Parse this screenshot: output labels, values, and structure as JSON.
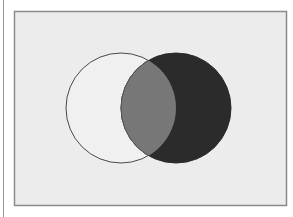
{
  "diagram": {
    "type": "venn",
    "frame": {
      "x": 14,
      "y": 11,
      "width": 272,
      "height": 194,
      "fill": "#ececec",
      "stroke": "#8a8a8a"
    },
    "sets": [
      {
        "name": "A",
        "cx": 121,
        "cy": 108,
        "r": 55,
        "fill": "#f0f0f0",
        "stroke": "#4a4a4a"
      },
      {
        "name": "B",
        "cx": 176,
        "cy": 108,
        "r": 55,
        "fill": "#2b2b2b",
        "stroke": "#2b2b2b"
      }
    ],
    "intersection": {
      "fill": "#777777",
      "stroke": "#555555"
    }
  }
}
